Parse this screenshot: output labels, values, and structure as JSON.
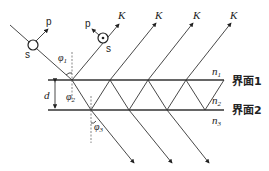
{
  "diagram": {
    "interfaces": [
      {
        "label": "界面1",
        "index_above": "n",
        "index_above_sub": "1"
      },
      {
        "label": "界面2",
        "index_above": "n",
        "index_above_sub": "2",
        "index_below": "n",
        "index_below_sub": "3"
      }
    ],
    "thickness_label": "d",
    "angles": [
      {
        "symbol": "φ",
        "sub": "1"
      },
      {
        "symbol": "φ",
        "sub": "2"
      },
      {
        "symbol": "φ",
        "sub": "3"
      }
    ],
    "polarization": {
      "incident": {
        "p": "p",
        "s": "s"
      },
      "reflected": {
        "p": "p",
        "s": "s",
        "k": "K"
      }
    },
    "reflected_k_labels": [
      "K",
      "K",
      "K"
    ],
    "transmitted_beam_count": 3
  }
}
